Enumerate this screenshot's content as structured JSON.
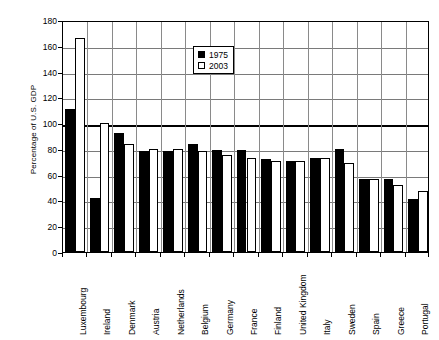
{
  "chart_data": {
    "type": "bar",
    "title": "",
    "subtitle": "",
    "xlabel": "",
    "ylabel": "Percentage of U.S. GDP",
    "ylim": [
      0,
      180
    ],
    "ytick_step": 20,
    "yticks": [
      0,
      20,
      40,
      60,
      80,
      100,
      120,
      140,
      160,
      180
    ],
    "ytick_labels": [
      "0",
      "20",
      "40",
      "60",
      "80",
      "100",
      "120",
      "140",
      "160",
      "180"
    ],
    "grid": true,
    "grid_axis": "y",
    "emphasis_gridline": 100,
    "legend_position": "upper-center",
    "categories": [
      "Luxembourg",
      "Ireland",
      "Denmark",
      "Austria",
      "Netherlands",
      "Belgium",
      "Germany",
      "France",
      "Finland",
      "United Kingdom",
      "Italy",
      "Sweden",
      "Spain",
      "Greece",
      "Portugal"
    ],
    "series": [
      {
        "name": "1975",
        "color": "#000000",
        "style": "filled",
        "values": [
          111,
          42,
          92,
          78,
          78,
          84,
          79,
          79,
          72,
          71,
          73,
          80,
          57,
          57,
          41
        ]
      },
      {
        "name": "2003",
        "color": "#ffffff",
        "style": "hollow",
        "values": [
          166,
          100,
          84,
          80,
          80,
          78,
          75,
          73,
          71,
          71,
          73,
          69,
          57,
          52,
          47
        ]
      }
    ]
  },
  "legend": {
    "items": [
      {
        "label": "1975",
        "style": "filled"
      },
      {
        "label": "2003",
        "style": "hollow"
      }
    ]
  }
}
